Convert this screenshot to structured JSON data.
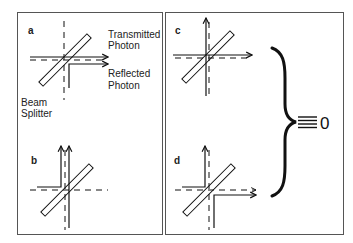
{
  "figure": {
    "panels": [
      {
        "id": "a",
        "label": "a"
      },
      {
        "id": "b",
        "label": "b"
      },
      {
        "id": "c",
        "label": "c"
      },
      {
        "id": "d",
        "label": "d"
      }
    ],
    "annotations": {
      "transmitted_line1": "Transmitted",
      "transmitted_line2": "Photon",
      "reflected_line1": "Reflected",
      "reflected_line2": "Photon",
      "beam_splitter_line1": "Beam",
      "beam_splitter_line2": "Splitter"
    },
    "equivalence": {
      "symbol": "≡",
      "value": "0"
    },
    "colors": {
      "line": "#111111",
      "frame": "#555555",
      "background": "#ffffff"
    }
  }
}
